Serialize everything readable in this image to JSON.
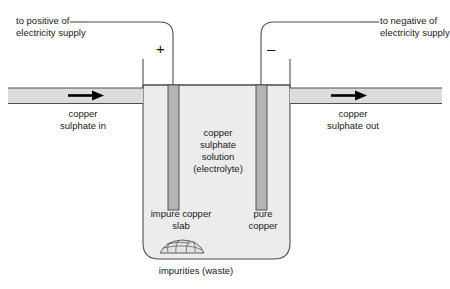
{
  "diagram": {
    "colors": {
      "outline": "#4d4d4d",
      "pipe_fill": "#dcdcdc",
      "tank_fill": "#ececec",
      "electrode_fill": "#b4b4b4",
      "electrode_outline": "#555555",
      "impurity_fill": "#e4e4e4",
      "text": "#1a1a1a",
      "arrow": "#000000",
      "background": "#ffffff"
    },
    "labels": {
      "positive_supply": "to positive of\nelectricity supply",
      "negative_supply": "to negative of\nelectricity supply",
      "inlet": "copper\nsulphate in",
      "outlet": "copper\nsulphate out",
      "electrolyte": "copper\nsulphate\nsolution\n(electrolyte)",
      "anode": "impure copper\nslab",
      "cathode": "pure\ncopper",
      "impurities": "impurities (waste)"
    },
    "terminals": {
      "positive_sign": "+",
      "negative_sign": "–"
    },
    "icons": {
      "inlet_arrow": "flow-arrow-right-icon",
      "outlet_arrow": "flow-arrow-right-icon",
      "impurities": "sediment-cluster-icon"
    }
  }
}
